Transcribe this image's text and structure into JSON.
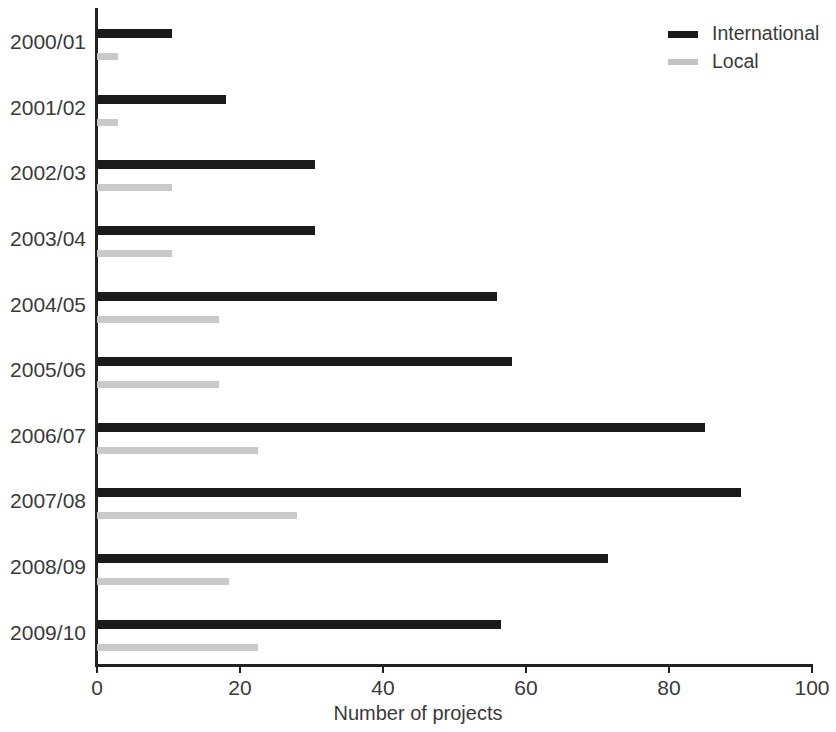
{
  "chart_data": {
    "type": "bar",
    "orientation": "horizontal",
    "title": "",
    "xlabel": "Number of projects",
    "ylabel": "",
    "xlim": [
      0,
      100
    ],
    "xticks": [
      0,
      20,
      40,
      60,
      80,
      100
    ],
    "xtick_labels": [
      "0",
      "20",
      "40",
      "60",
      "80",
      "100"
    ],
    "grid": false,
    "legend_position": "top-right",
    "categories": [
      "2000/01",
      "2001/02",
      "2002/03",
      "2003/04",
      "2004/05",
      "2005/06",
      "2006/07",
      "2007/08",
      "2008/09",
      "2009/10"
    ],
    "series": [
      {
        "name": "International",
        "color": "#1a1a1a",
        "values": [
          10.5,
          18,
          30.5,
          30.5,
          56,
          58,
          85,
          90,
          71.5,
          56.5
        ]
      },
      {
        "name": "Local",
        "color": "#c9c9c9",
        "values": [
          3,
          3,
          10.5,
          10.5,
          17,
          17,
          22.5,
          28,
          18.5,
          22.5
        ]
      }
    ]
  },
  "legend": {
    "items": [
      {
        "label": "International",
        "swatch": "international-swatch"
      },
      {
        "label": "Local",
        "swatch": "local-swatch"
      }
    ]
  },
  "axis": {
    "x_title": "Number of projects"
  }
}
